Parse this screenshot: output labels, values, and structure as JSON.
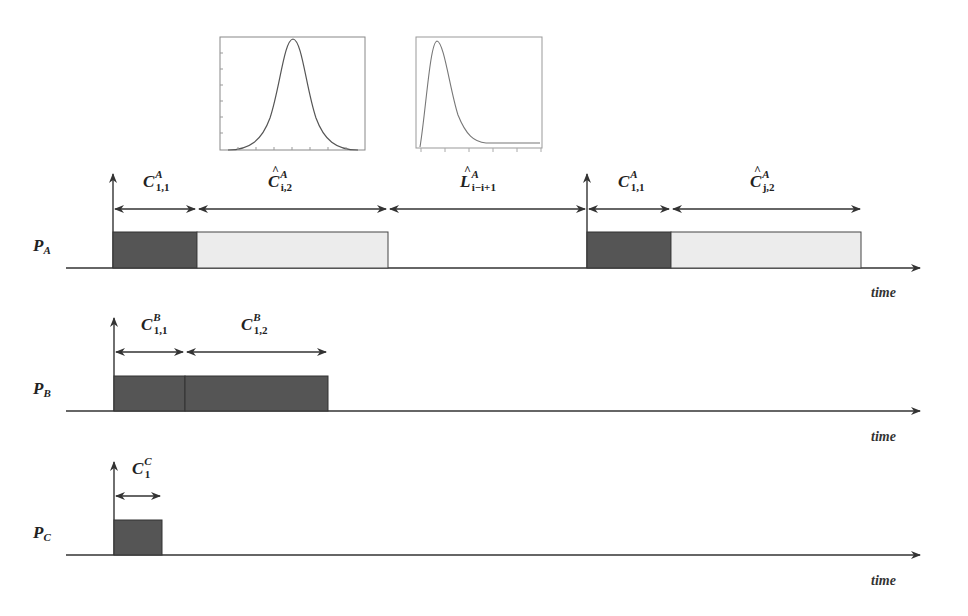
{
  "diagram": {
    "insets": [
      {
        "name": "gaussian-distribution-plot",
        "type": "line",
        "shape": "symmetric bell curve"
      },
      {
        "name": "skewed-distribution-plot",
        "type": "line",
        "shape": "right-skewed (log-normal-like) curve"
      }
    ],
    "processors": [
      {
        "label": "P",
        "sub": "A",
        "axis_label": "time",
        "segments": [
          {
            "label": "C",
            "hat": false,
            "sup": "A",
            "sub": "1,1",
            "kind": "measured",
            "color": "#555555"
          },
          {
            "label": "C",
            "hat": true,
            "sup": "A",
            "sub": "i,2",
            "kind": "estimated",
            "color": "#ececec"
          },
          {
            "label": "L",
            "hat": true,
            "sup": "A",
            "sub": "i−i+1",
            "kind": "idle"
          },
          {
            "label": "C",
            "hat": false,
            "sup": "A",
            "sub": "1,1",
            "kind": "measured",
            "color": "#555555"
          },
          {
            "label": "C",
            "hat": true,
            "sup": "A",
            "sub": "j,2",
            "kind": "estimated",
            "color": "#ececec"
          }
        ]
      },
      {
        "label": "P",
        "sub": "B",
        "axis_label": "time",
        "segments": [
          {
            "label": "C",
            "hat": false,
            "sup": "B",
            "sub": "1,1",
            "kind": "measured",
            "color": "#555555"
          },
          {
            "label": "C",
            "hat": false,
            "sup": "B",
            "sub": "1,2",
            "kind": "measured",
            "color": "#555555"
          }
        ]
      },
      {
        "label": "P",
        "sub": "C",
        "axis_label": "time",
        "segments": [
          {
            "label": "C",
            "hat": false,
            "sup": "C",
            "sub": "1",
            "kind": "measured",
            "color": "#555555"
          }
        ]
      }
    ],
    "colors": {
      "measured_fill": "#555555",
      "estimated_fill": "#ececec",
      "line": "#333333"
    }
  }
}
